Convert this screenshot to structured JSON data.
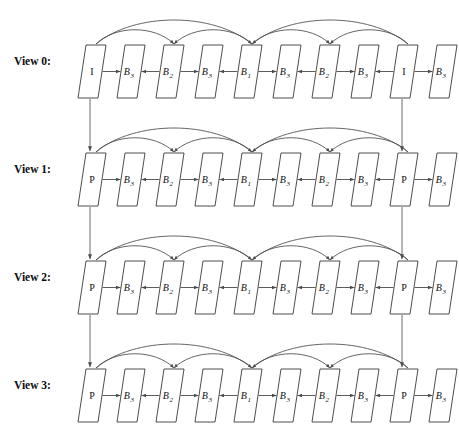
{
  "figure": {
    "type": "diagram",
    "background_color": "#ffffff",
    "line_color": "#4a4a4a",
    "text_color": "#111111",
    "width": 459,
    "height": 443
  },
  "geometry": {
    "frame_width": 20,
    "frame_height": 53,
    "frame_slant": 8,
    "row_tops": [
      45,
      153,
      261,
      369
    ],
    "frame_lefts": [
      78,
      117,
      156,
      195,
      234,
      273,
      312,
      351,
      390,
      429
    ],
    "label_x": 14,
    "label_baselines": [
      65,
      173,
      281,
      389
    ]
  },
  "views": [
    {
      "label": "View 0:",
      "name": "view-0",
      "frames": [
        {
          "base": "I",
          "sub": "",
          "index": 0
        },
        {
          "base": "B",
          "sub": "3",
          "index": 1
        },
        {
          "base": "B",
          "sub": "2",
          "index": 2
        },
        {
          "base": "B",
          "sub": "3",
          "index": 3
        },
        {
          "base": "B",
          "sub": "1",
          "index": 4
        },
        {
          "base": "B",
          "sub": "3",
          "index": 5
        },
        {
          "base": "B",
          "sub": "2",
          "index": 6
        },
        {
          "base": "B",
          "sub": "3",
          "index": 7
        },
        {
          "base": "I",
          "sub": "",
          "index": 8
        },
        {
          "base": "B",
          "sub": "3",
          "index": 9
        }
      ]
    },
    {
      "label": "View 1:",
      "name": "view-1",
      "frames": [
        {
          "base": "P",
          "sub": "",
          "index": 0
        },
        {
          "base": "B",
          "sub": "3",
          "index": 1
        },
        {
          "base": "B",
          "sub": "2",
          "index": 2
        },
        {
          "base": "B",
          "sub": "3",
          "index": 3
        },
        {
          "base": "B",
          "sub": "1",
          "index": 4
        },
        {
          "base": "B",
          "sub": "3",
          "index": 5
        },
        {
          "base": "B",
          "sub": "2",
          "index": 6
        },
        {
          "base": "B",
          "sub": "3",
          "index": 7
        },
        {
          "base": "P",
          "sub": "",
          "index": 8
        },
        {
          "base": "B",
          "sub": "3",
          "index": 9
        }
      ]
    },
    {
      "label": "View 2:",
      "name": "view-2",
      "frames": [
        {
          "base": "P",
          "sub": "",
          "index": 0
        },
        {
          "base": "B",
          "sub": "3",
          "index": 1
        },
        {
          "base": "B",
          "sub": "2",
          "index": 2
        },
        {
          "base": "B",
          "sub": "3",
          "index": 3
        },
        {
          "base": "B",
          "sub": "1",
          "index": 4
        },
        {
          "base": "B",
          "sub": "3",
          "index": 5
        },
        {
          "base": "B",
          "sub": "2",
          "index": 6
        },
        {
          "base": "B",
          "sub": "3",
          "index": 7
        },
        {
          "base": "P",
          "sub": "",
          "index": 8
        },
        {
          "base": "B",
          "sub": "3",
          "index": 9
        }
      ]
    },
    {
      "label": "View 3:",
      "name": "view-3",
      "frames": [
        {
          "base": "P",
          "sub": "",
          "index": 0
        },
        {
          "base": "B",
          "sub": "3",
          "index": 1
        },
        {
          "base": "B",
          "sub": "2",
          "index": 2
        },
        {
          "base": "B",
          "sub": "3",
          "index": 3
        },
        {
          "base": "B",
          "sub": "1",
          "index": 4
        },
        {
          "base": "B",
          "sub": "3",
          "index": 5
        },
        {
          "base": "B",
          "sub": "2",
          "index": 6
        },
        {
          "base": "B",
          "sub": "3",
          "index": 7
        },
        {
          "base": "P",
          "sub": "",
          "index": 8
        },
        {
          "base": "B",
          "sub": "3",
          "index": 9
        }
      ]
    }
  ],
  "horizontal_arrows": [
    {
      "from": 0,
      "to": 1,
      "direction": "right"
    },
    {
      "from": 2,
      "to": 1,
      "direction": "left"
    },
    {
      "from": 2,
      "to": 3,
      "direction": "right"
    },
    {
      "from": 4,
      "to": 3,
      "direction": "left"
    },
    {
      "from": 4,
      "to": 5,
      "direction": "right"
    },
    {
      "from": 6,
      "to": 5,
      "direction": "left"
    },
    {
      "from": 6,
      "to": 7,
      "direction": "right"
    },
    {
      "from": 8,
      "to": 7,
      "direction": "left"
    },
    {
      "from": 8,
      "to": 9,
      "direction": "right"
    }
  ],
  "temporal_arcs": [
    {
      "from": 0,
      "to": 2,
      "level": 1
    },
    {
      "from": 0,
      "to": 4,
      "level": 2
    },
    {
      "from": 4,
      "to": 2,
      "level": 1
    },
    {
      "from": 4,
      "to": 6,
      "level": 1
    },
    {
      "from": 8,
      "to": 6,
      "level": 1
    },
    {
      "from": 8,
      "to": 4,
      "level": 2
    }
  ],
  "inter_view_arrows": [
    {
      "frame_index": 0,
      "from_view": 0,
      "to_view": 1
    },
    {
      "frame_index": 8,
      "from_view": 0,
      "to_view": 1
    },
    {
      "frame_index": 0,
      "from_view": 1,
      "to_view": 2
    },
    {
      "frame_index": 8,
      "from_view": 1,
      "to_view": 2
    },
    {
      "frame_index": 0,
      "from_view": 2,
      "to_view": 3
    },
    {
      "frame_index": 8,
      "from_view": 2,
      "to_view": 3
    }
  ]
}
